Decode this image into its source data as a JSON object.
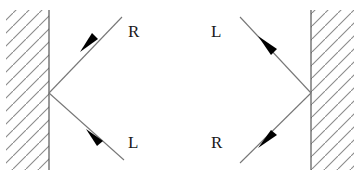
{
  "figure": {
    "background_color": "#ffffff",
    "width": 360,
    "height": 179,
    "line_color": "#555555",
    "hatch_color": "#8a8a8a",
    "arrow_color": "#000000",
    "label_color": "#1a1a1a"
  },
  "panels": [
    {
      "id": "left-panel",
      "name": "left-mirror-diagram",
      "mirror": {
        "name": "left-mirror-wall",
        "orientation": "vertical",
        "x": 49,
        "y_top": 10,
        "y_bottom": 170,
        "hatch_side": "left",
        "hatch_slope": "positive"
      },
      "vertex": {
        "x": 49,
        "y": 93
      },
      "rays": [
        {
          "name": "left-outgoing-upper-ray",
          "from": {
            "x": 49,
            "y": 93
          },
          "to": {
            "x": 122,
            "y": 17
          },
          "arrow_at": {
            "x": 90,
            "y": 43
          },
          "arrow_direction": "down-left",
          "label": "R",
          "label_x": 128,
          "label_y": 23
        },
        {
          "name": "left-outgoing-lower-ray",
          "from": {
            "x": 49,
            "y": 93
          },
          "to": {
            "x": 124,
            "y": 160
          },
          "arrow_at": {
            "x": 95,
            "y": 136
          },
          "arrow_direction": "up-left",
          "label": "L",
          "label_x": 128,
          "label_y": 134
        }
      ]
    },
    {
      "id": "right-panel",
      "name": "right-mirror-diagram",
      "mirror": {
        "name": "right-mirror-wall",
        "orientation": "vertical",
        "x": 311,
        "y_top": 10,
        "y_bottom": 170,
        "hatch_side": "right",
        "hatch_slope": "positive"
      },
      "vertex": {
        "x": 311,
        "y": 93
      },
      "rays": [
        {
          "name": "right-outgoing-upper-ray",
          "from": {
            "x": 311,
            "y": 93
          },
          "to": {
            "x": 240,
            "y": 17
          },
          "arrow_at": {
            "x": 270,
            "y": 49
          },
          "arrow_direction": "down-left",
          "label": "L",
          "label_x": 211,
          "label_y": 23
        },
        {
          "name": "right-outgoing-lower-ray",
          "from": {
            "x": 311,
            "y": 93
          },
          "to": {
            "x": 240,
            "y": 163
          },
          "arrow_at": {
            "x": 268,
            "y": 136
          },
          "arrow_direction": "up-left",
          "label": "R",
          "label_x": 211,
          "label_y": 134
        }
      ]
    }
  ],
  "labels": {
    "left_upper": "R",
    "left_lower": "L",
    "right_upper": "L",
    "right_lower": "R"
  }
}
